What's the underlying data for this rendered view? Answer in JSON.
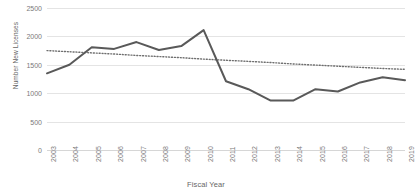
{
  "chart_data": {
    "type": "line",
    "title": "",
    "xlabel": "Fiscal Year",
    "ylabel": "Number New Licenses",
    "categories": [
      "2003",
      "2004",
      "2005",
      "2006",
      "2007",
      "2008",
      "2009",
      "2010",
      "2011",
      "2012",
      "2013",
      "2014",
      "2015",
      "2016",
      "2017",
      "2018",
      "2019"
    ],
    "ylim": [
      0,
      2500
    ],
    "yticks": [
      0,
      500,
      1000,
      1500,
      2000,
      2500
    ],
    "ytick_labels": [
      "0",
      "500",
      "1000",
      "1500",
      "2000",
      "2500"
    ],
    "grid": true,
    "legend": "none",
    "series": [
      {
        "name": "Number New Licenses",
        "style": "solid",
        "color": "#595959",
        "values": [
          1350,
          1500,
          1810,
          1780,
          1900,
          1760,
          1830,
          2110,
          1210,
          1070,
          870,
          870,
          1070,
          1030,
          1190,
          1280,
          1230
        ]
      },
      {
        "name": "Linear trendline",
        "style": "dotted",
        "color": "#6e6e6e",
        "values": [
          1750,
          1730,
          1710,
          1690,
          1665,
          1645,
          1625,
          1600,
          1580,
          1560,
          1540,
          1515,
          1495,
          1475,
          1455,
          1435,
          1420
        ]
      }
    ]
  },
  "axes": {
    "y_title": "Number New Licenses",
    "x_title": "Fiscal Year"
  }
}
